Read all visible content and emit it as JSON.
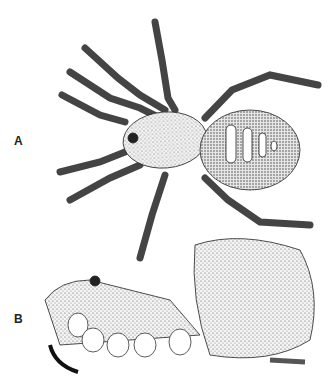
{
  "figure": {
    "panels": [
      {
        "label": "A",
        "description": "Dorsal view of spider"
      },
      {
        "label": "B",
        "description": "Lateral view of spider"
      }
    ]
  }
}
